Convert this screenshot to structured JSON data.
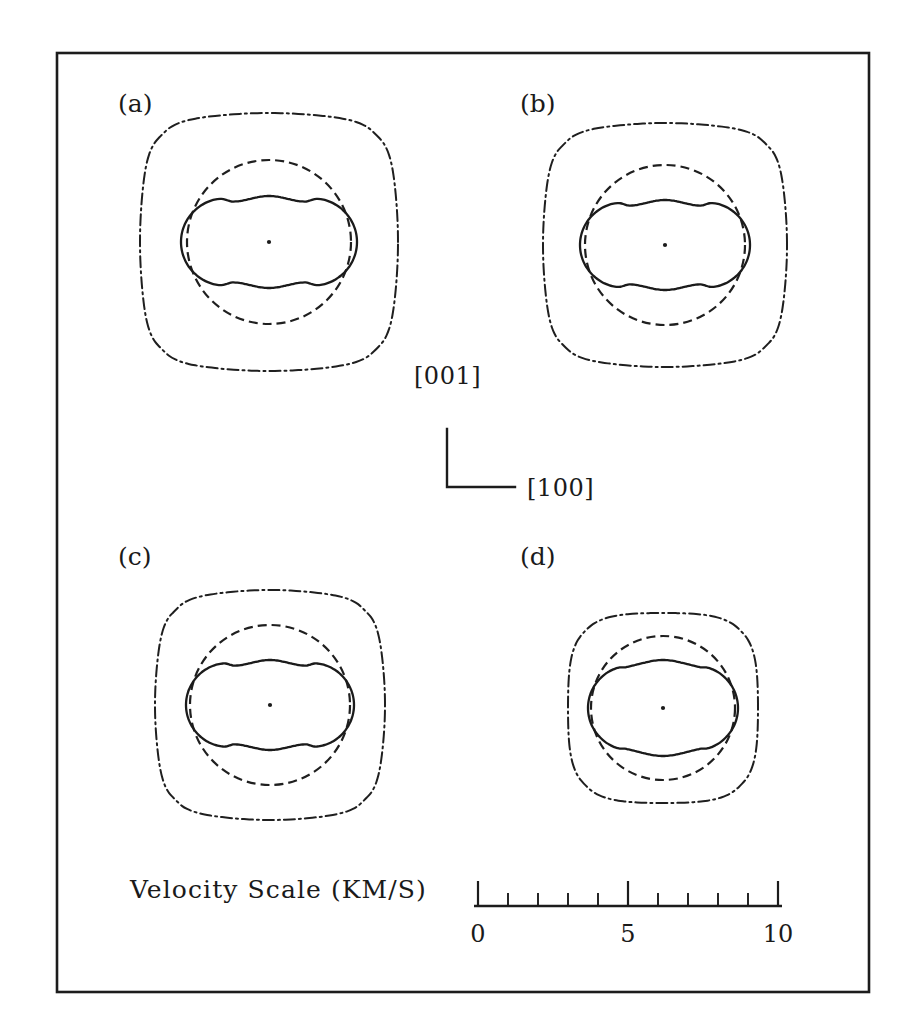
{
  "figure": {
    "top_partial_caption": "",
    "frame": {
      "x": 57,
      "y": 53,
      "width": 812,
      "height": 939
    }
  },
  "axes_indicator": {
    "vertical_label": "[001]",
    "horizontal_label": "[100]",
    "corner_x": 447,
    "corner_y": 487,
    "arm_length_v": 58,
    "arm_length_h": 68
  },
  "scale": {
    "title": "Velocity Scale (KM/S)",
    "unit": "KM/S",
    "min": 0,
    "max": 10,
    "major_ticks": [
      0,
      5,
      10
    ],
    "major_tick_labels": [
      "0",
      "5",
      "10"
    ],
    "minor_ticks": [
      1,
      2,
      3,
      4,
      6,
      7,
      8,
      9
    ],
    "px_per_unit": 30,
    "x_origin": 478,
    "baseline_y": 906,
    "title_x": 130,
    "title_y": 898
  },
  "panels": [
    {
      "label": "(a)",
      "label_x": 118,
      "label_y": 112,
      "cx": 269,
      "cy": 242,
      "p_wave": {
        "r_axis": 129,
        "r_diag": 120,
        "squareness": 0.78
      },
      "s_fast": {
        "r_axis": 82,
        "r_diag": 82,
        "squareness": 0.0
      },
      "s_slow": {
        "r_axis": 88,
        "r_diag": 46,
        "lobe_sharp": 0.55
      }
    },
    {
      "label": "(b)",
      "label_x": 520,
      "label_y": 112,
      "cx": 665,
      "cy": 245,
      "p_wave": {
        "r_axis": 122,
        "r_diag": 113,
        "squareness": 0.76
      },
      "s_fast": {
        "r_axis": 80,
        "r_diag": 80,
        "squareness": 0.0
      },
      "s_slow": {
        "r_axis": 85,
        "r_diag": 45,
        "lobe_sharp": 0.55
      }
    },
    {
      "label": "(c)",
      "label_x": 118,
      "label_y": 565,
      "cx": 270,
      "cy": 705,
      "p_wave": {
        "r_axis": 115,
        "r_diag": 106,
        "squareness": 0.72
      },
      "s_fast": {
        "r_axis": 80,
        "r_diag": 80,
        "squareness": 0.0
      },
      "s_slow": {
        "r_axis": 84,
        "r_diag": 45,
        "lobe_sharp": 0.54
      }
    },
    {
      "label": "(d)",
      "label_x": 520,
      "label_y": 565,
      "cx": 663,
      "cy": 708,
      "p_wave": {
        "r_axis": 95,
        "r_diag": 92,
        "squareness": 0.3
      },
      "s_fast": {
        "r_axis": 72,
        "r_diag": 72,
        "squareness": 0.0
      },
      "s_slow": {
        "r_axis": 75,
        "r_diag": 48,
        "lobe_sharp": 0.4
      }
    }
  ],
  "chart_data": {
    "type": "line",
    "title": "",
    "subtitle": "",
    "xlabel": "[100]",
    "ylabel": "[001]",
    "legend_position": "none",
    "grid": false,
    "angle_unit": "degrees",
    "radial_unit": "KM/S",
    "radial_range": [
      0,
      10
    ],
    "sample_angles_deg": [
      0,
      45,
      90,
      135,
      180,
      225,
      270,
      315
    ],
    "series": [
      {
        "name": "quasi-P (dash-dot)",
        "style": "dash-dot",
        "panels": {
          "a": {
            "axis_velocity": 8.6,
            "diagonal_velocity": 8.0,
            "max": 8.6,
            "min": 8.0
          },
          "b": {
            "axis_velocity": 8.1,
            "diagonal_velocity": 7.5,
            "max": 8.1,
            "min": 7.5
          },
          "c": {
            "axis_velocity": 7.7,
            "diagonal_velocity": 7.1,
            "max": 7.7,
            "min": 7.1
          },
          "d": {
            "axis_velocity": 6.3,
            "diagonal_velocity": 6.1,
            "max": 6.3,
            "min": 6.1
          }
        }
      },
      {
        "name": "fast quasi-S (dashed circle)",
        "style": "dashed",
        "panels": {
          "a": {
            "axis_velocity": 5.5,
            "diagonal_velocity": 5.5,
            "max": 5.5,
            "min": 5.5
          },
          "b": {
            "axis_velocity": 5.3,
            "diagonal_velocity": 5.3,
            "max": 5.3,
            "min": 5.3
          },
          "c": {
            "axis_velocity": 5.3,
            "diagonal_velocity": 5.3,
            "max": 5.3,
            "min": 5.3
          },
          "d": {
            "axis_velocity": 4.8,
            "diagonal_velocity": 4.8,
            "max": 4.8,
            "min": 4.8
          }
        }
      },
      {
        "name": "slow quasi-S (solid four-lobed)",
        "style": "solid",
        "panels": {
          "a": {
            "axis_velocity": 5.9,
            "diagonal_velocity": 3.1,
            "max": 5.9,
            "min": 3.1
          },
          "b": {
            "axis_velocity": 5.7,
            "diagonal_velocity": 3.0,
            "max": 5.7,
            "min": 3.0
          },
          "c": {
            "axis_velocity": 5.6,
            "diagonal_velocity": 3.0,
            "max": 5.6,
            "min": 3.0
          },
          "d": {
            "axis_velocity": 5.0,
            "diagonal_velocity": 3.2,
            "max": 5.0,
            "min": 3.2
          }
        }
      }
    ]
  }
}
